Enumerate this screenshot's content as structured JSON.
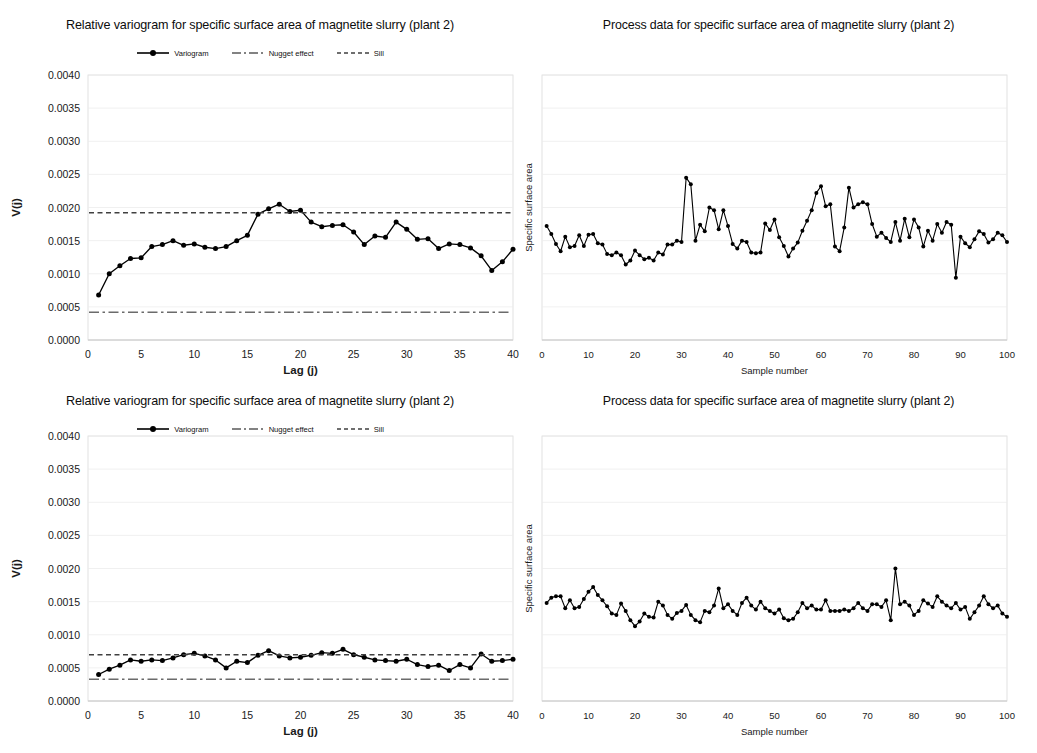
{
  "figure": {
    "panels": [
      {
        "id": "top-left",
        "kind": "variogram",
        "title": "Relative variogram for specific surface area of magnetite slurry (plant 2)",
        "legend": [
          {
            "label": "Variogram",
            "style": "line-marker",
            "color": "#000000"
          },
          {
            "label": "Nugget effect",
            "style": "dash-dot",
            "color": "#595959"
          },
          {
            "label": "Sill",
            "style": "dashed",
            "color": "#404040"
          }
        ]
      },
      {
        "id": "top-right",
        "kind": "process",
        "title": "Process data for specific surface area of magnetite slurry (plant 2)"
      },
      {
        "id": "bottom-left",
        "kind": "variogram",
        "title": "Relative variogram for specific surface area of magnetite slurry (plant 2)",
        "legend": [
          {
            "label": "Variogram",
            "style": "line-marker",
            "color": "#000000"
          },
          {
            "label": "Nugget effect",
            "style": "dash-dot",
            "color": "#595959"
          },
          {
            "label": "Sill",
            "style": "dashed",
            "color": "#404040"
          }
        ]
      },
      {
        "id": "bottom-right",
        "kind": "process",
        "title": "Process data for specific surface area of magnetite slurry (plant 2)"
      }
    ]
  },
  "chart_data": [
    {
      "panel": "top-left",
      "type": "line",
      "title": "Relative variogram for specific surface area of magnetite slurry (plant 2)",
      "xlabel": "Lag (j)",
      "ylabel": "V(j)",
      "xlim": [
        0,
        40
      ],
      "ylim": [
        0.0,
        0.004
      ],
      "xticks": [
        0,
        5,
        10,
        15,
        20,
        25,
        30,
        35,
        40
      ],
      "yticks": [
        0.0,
        0.0005,
        0.001,
        0.0015,
        0.002,
        0.0025,
        0.003,
        0.0035,
        0.004
      ],
      "ytick_labels": [
        "0.0000",
        "0.0005",
        "0.0010",
        "0.0015",
        "0.0020",
        "0.0025",
        "0.0030",
        "0.0035",
        "0.0040"
      ],
      "grid": "horizontal",
      "legend_position": "top-center",
      "series": [
        {
          "name": "Variogram",
          "marker": "circle",
          "x": [
            1,
            2,
            3,
            4,
            5,
            6,
            7,
            8,
            9,
            10,
            11,
            12,
            13,
            14,
            15,
            16,
            17,
            18,
            19,
            20,
            21,
            22,
            23,
            24,
            25,
            26,
            27,
            28,
            29,
            30,
            31,
            32,
            33,
            34,
            35,
            36,
            37,
            38,
            39,
            40
          ],
          "values": [
            0.00068,
            0.001,
            0.00112,
            0.00123,
            0.00124,
            0.00141,
            0.00144,
            0.0015,
            0.00143,
            0.00145,
            0.0014,
            0.00138,
            0.00141,
            0.0015,
            0.00158,
            0.0019,
            0.00198,
            0.00205,
            0.00194,
            0.00196,
            0.00178,
            0.00171,
            0.00173,
            0.00174,
            0.00163,
            0.00144,
            0.00157,
            0.00155,
            0.00178,
            0.00167,
            0.00152,
            0.00153,
            0.00138,
            0.00145,
            0.00144,
            0.00139,
            0.00127,
            0.00105,
            0.00118,
            0.00137
          ]
        },
        {
          "name": "Nugget effect",
          "type": "hline",
          "value": 0.00042
        },
        {
          "name": "Sill",
          "type": "hline",
          "value": 0.00192
        }
      ]
    },
    {
      "panel": "top-right",
      "type": "line",
      "title": "Process data for specific surface area of magnetite slurry (plant 2)",
      "xlabel": "Sample number",
      "ylabel": "Specific surface area",
      "xlim": [
        0,
        100
      ],
      "ylim": [
        0.0,
        0.004
      ],
      "xticks": [
        0,
        10,
        20,
        30,
        40,
        50,
        60,
        70,
        80,
        90,
        100
      ],
      "ytick_labels": [],
      "grid": "horizontal",
      "series": [
        {
          "name": "Specific surface area",
          "marker": "circle",
          "x": [
            1,
            2,
            3,
            4,
            5,
            6,
            7,
            8,
            9,
            10,
            11,
            12,
            13,
            14,
            15,
            16,
            17,
            18,
            19,
            20,
            21,
            22,
            23,
            24,
            25,
            26,
            27,
            28,
            29,
            30,
            31,
            32,
            33,
            34,
            35,
            36,
            37,
            38,
            39,
            40,
            41,
            42,
            43,
            44,
            45,
            46,
            47,
            48,
            49,
            50,
            51,
            52,
            53,
            54,
            55,
            56,
            57,
            58,
            59,
            60,
            61,
            62,
            63,
            64,
            65,
            66,
            67,
            68,
            69,
            70,
            71,
            72,
            73,
            74,
            75,
            76,
            77,
            78,
            79,
            80,
            81,
            82,
            83,
            84,
            85,
            86,
            87,
            88,
            89,
            90,
            91,
            92,
            93,
            94,
            95,
            96,
            97,
            98,
            99,
            100
          ],
          "values": [
            0.00172,
            0.0016,
            0.00145,
            0.00134,
            0.00156,
            0.0014,
            0.00142,
            0.00158,
            0.00142,
            0.00159,
            0.0016,
            0.00146,
            0.00144,
            0.0013,
            0.00128,
            0.00132,
            0.00128,
            0.00114,
            0.0012,
            0.00135,
            0.00128,
            0.00122,
            0.00124,
            0.0012,
            0.00132,
            0.00129,
            0.00144,
            0.00144,
            0.0015,
            0.00148,
            0.00245,
            0.00235,
            0.0015,
            0.00174,
            0.00164,
            0.002,
            0.00196,
            0.00167,
            0.00196,
            0.00172,
            0.00145,
            0.00138,
            0.0015,
            0.00148,
            0.00132,
            0.00131,
            0.00132,
            0.00176,
            0.00166,
            0.00182,
            0.00155,
            0.00142,
            0.00126,
            0.00138,
            0.00147,
            0.00165,
            0.0018,
            0.00196,
            0.00222,
            0.00232,
            0.00202,
            0.00205,
            0.00141,
            0.00134,
            0.0017,
            0.0023,
            0.002,
            0.00205,
            0.00208,
            0.00205,
            0.00175,
            0.00156,
            0.00162,
            0.00154,
            0.00148,
            0.00178,
            0.0015,
            0.00183,
            0.00155,
            0.00182,
            0.0017,
            0.00141,
            0.00165,
            0.0015,
            0.00175,
            0.00162,
            0.00178,
            0.00174,
            0.00094,
            0.00156,
            0.00146,
            0.0014,
            0.00152,
            0.00164,
            0.0016,
            0.00147,
            0.00152,
            0.00162,
            0.00158,
            0.00148
          ]
        }
      ]
    },
    {
      "panel": "bottom-left",
      "type": "line",
      "title": "Relative variogram for specific surface area of magnetite slurry (plant 2)",
      "xlabel": "Lag (j)",
      "ylabel": "V(j)",
      "xlim": [
        0,
        40
      ],
      "ylim": [
        0.0,
        0.004
      ],
      "xticks": [
        0,
        5,
        10,
        15,
        20,
        25,
        30,
        35,
        40
      ],
      "yticks": [
        0.0,
        0.0005,
        0.001,
        0.0015,
        0.002,
        0.0025,
        0.003,
        0.0035,
        0.004
      ],
      "ytick_labels": [
        "0.0000",
        "0.0005",
        "0.0010",
        "0.0015",
        "0.0020",
        "0.0025",
        "0.0030",
        "0.0035",
        "0.0040"
      ],
      "grid": "horizontal",
      "legend_position": "top-center",
      "series": [
        {
          "name": "Variogram",
          "marker": "circle",
          "x": [
            1,
            2,
            3,
            4,
            5,
            6,
            7,
            8,
            9,
            10,
            11,
            12,
            13,
            14,
            15,
            16,
            17,
            18,
            19,
            20,
            21,
            22,
            23,
            24,
            25,
            26,
            27,
            28,
            29,
            30,
            31,
            32,
            33,
            34,
            35,
            36,
            37,
            38,
            39,
            40
          ],
          "values": [
            0.0004,
            0.00048,
            0.00054,
            0.00062,
            0.0006,
            0.00062,
            0.00061,
            0.00065,
            0.0007,
            0.00072,
            0.00068,
            0.00062,
            0.0005,
            0.0006,
            0.00058,
            0.00069,
            0.00076,
            0.00068,
            0.00065,
            0.00066,
            0.00069,
            0.00073,
            0.00072,
            0.00078,
            0.0007,
            0.00066,
            0.00062,
            0.00061,
            0.0006,
            0.00063,
            0.00055,
            0.00052,
            0.00054,
            0.00046,
            0.00055,
            0.0005,
            0.00071,
            0.0006,
            0.00061,
            0.00063
          ]
        },
        {
          "name": "Nugget effect",
          "type": "hline",
          "value": 0.00033
        },
        {
          "name": "Sill",
          "type": "hline",
          "value": 0.0007
        }
      ]
    },
    {
      "panel": "bottom-right",
      "type": "line",
      "title": "Process data for specific surface area of magnetite slurry (plant 2)",
      "xlabel": "Sample number",
      "ylabel": "Specific surface area",
      "xlim": [
        0,
        100
      ],
      "ylim": [
        0.0,
        0.004
      ],
      "xticks": [
        0,
        10,
        20,
        30,
        40,
        50,
        60,
        70,
        80,
        90,
        100
      ],
      "ytick_labels": [],
      "grid": "horizontal",
      "series": [
        {
          "name": "Specific surface area",
          "marker": "circle",
          "x": [
            1,
            2,
            3,
            4,
            5,
            6,
            7,
            8,
            9,
            10,
            11,
            12,
            13,
            14,
            15,
            16,
            17,
            18,
            19,
            20,
            21,
            22,
            23,
            24,
            25,
            26,
            27,
            28,
            29,
            30,
            31,
            32,
            33,
            34,
            35,
            36,
            37,
            38,
            39,
            40,
            41,
            42,
            43,
            44,
            45,
            46,
            47,
            48,
            49,
            50,
            51,
            52,
            53,
            54,
            55,
            56,
            57,
            58,
            59,
            60,
            61,
            62,
            63,
            64,
            65,
            66,
            67,
            68,
            69,
            70,
            71,
            72,
            73,
            74,
            75,
            76,
            77,
            78,
            79,
            80,
            81,
            82,
            83,
            84,
            85,
            86,
            87,
            88,
            89,
            90,
            91,
            92,
            93,
            94,
            95,
            96,
            97,
            98,
            99,
            100
          ],
          "values": [
            0.00148,
            0.00156,
            0.00158,
            0.00158,
            0.0014,
            0.00152,
            0.0014,
            0.00142,
            0.00154,
            0.00165,
            0.00172,
            0.0016,
            0.00152,
            0.00143,
            0.00132,
            0.0013,
            0.00147,
            0.00136,
            0.00122,
            0.00113,
            0.0012,
            0.00132,
            0.00127,
            0.00126,
            0.0015,
            0.00144,
            0.0013,
            0.00124,
            0.00133,
            0.00136,
            0.00145,
            0.0013,
            0.00122,
            0.00119,
            0.00136,
            0.00134,
            0.00144,
            0.0017,
            0.0014,
            0.00146,
            0.00136,
            0.0013,
            0.00148,
            0.00156,
            0.00144,
            0.00138,
            0.0015,
            0.0014,
            0.00136,
            0.00132,
            0.00138,
            0.00125,
            0.00122,
            0.00124,
            0.00134,
            0.00148,
            0.0014,
            0.00144,
            0.00138,
            0.00138,
            0.00152,
            0.00136,
            0.00136,
            0.00136,
            0.00138,
            0.00136,
            0.0014,
            0.00148,
            0.0014,
            0.00136,
            0.00146,
            0.00146,
            0.00142,
            0.00152,
            0.00122,
            0.002,
            0.00146,
            0.0015,
            0.00144,
            0.0013,
            0.00136,
            0.00152,
            0.00147,
            0.00142,
            0.00158,
            0.0015,
            0.00144,
            0.0014,
            0.00148,
            0.00138,
            0.00142,
            0.00124,
            0.00134,
            0.00144,
            0.00158,
            0.00146,
            0.0014,
            0.00144,
            0.00132,
            0.00127
          ]
        }
      ]
    }
  ]
}
